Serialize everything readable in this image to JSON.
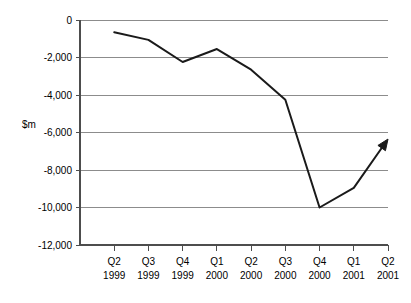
{
  "chart_data": {
    "type": "line",
    "title": "",
    "xlabel": "",
    "ylabel": "$m",
    "categories": [
      "Q2 1999",
      "Q3 1999",
      "Q4 1999",
      "Q1 2000",
      "Q2 2000",
      "Q3 2000",
      "Q4 2000",
      "Q1 2001",
      "Q2 2001"
    ],
    "category_lines": [
      [
        "Q2",
        "1999"
      ],
      [
        "Q3",
        "1999"
      ],
      [
        "Q4",
        "1999"
      ],
      [
        "Q1",
        "2000"
      ],
      [
        "Q2",
        "2000"
      ],
      [
        "Q3",
        "2000"
      ],
      [
        "Q4",
        "2000"
      ],
      [
        "Q1",
        "2001"
      ],
      [
        "Q2",
        "2001"
      ]
    ],
    "values": [
      -650,
      -1060,
      -2240,
      -1550,
      -2650,
      -4250,
      -10000,
      -8950,
      -6350
    ],
    "ylim": [
      -12000,
      0
    ],
    "ytick_values": [
      0,
      -2000,
      -4000,
      -6000,
      -8000,
      -10000,
      -12000
    ],
    "ytick_labels": [
      "0",
      "-2,000",
      "-4,000",
      "-6,000",
      "-8,000",
      "-10,000",
      "-12,000"
    ],
    "grid": true,
    "grid_axis": "y",
    "legend": "none",
    "series": [
      {
        "name": "",
        "values": [
          -650,
          -1060,
          -2240,
          -1550,
          -2650,
          -4250,
          -10000,
          -8950,
          -6350
        ],
        "color": "#1a1a1a",
        "line_width": 2,
        "end_marker": "arrow"
      }
    ],
    "colors": {
      "line": "#1a1a1a",
      "grid": "#8c8c8c",
      "axis": "#4d4d4d",
      "background": "#ffffff",
      "text": "#000000"
    },
    "annotations": [
      {
        "name": "trend-arrow",
        "type": "arrowhead",
        "at_category": "Q2 2001",
        "direction": "up-right"
      }
    ]
  }
}
